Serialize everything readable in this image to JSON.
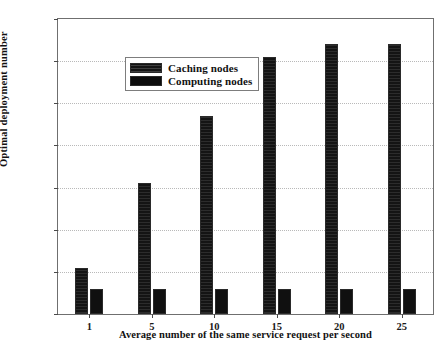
{
  "chart_data": {
    "type": "bar",
    "title": "",
    "xlabel": "Average number of the same service request per second",
    "ylabel": "Optimal deployment number",
    "categories": [
      "1",
      "5",
      "10",
      "15",
      "20",
      "25"
    ],
    "series": [
      {
        "name": "Caching nodes",
        "values": [
          11,
          31,
          47,
          61,
          64,
          64
        ]
      },
      {
        "name": "Computing nodes",
        "values": [
          6,
          6,
          6,
          6,
          6,
          6
        ]
      }
    ],
    "ylim": [
      0,
      70
    ],
    "yticks": [
      0,
      10,
      20,
      30,
      40,
      50,
      60,
      70
    ],
    "ytick_labels": [
      "0",
      "10",
      "20",
      "30",
      "40",
      "50",
      "60",
      "70"
    ],
    "grid": true,
    "grid_style": "dotted",
    "legend_position": "upper left",
    "colors": {
      "caching": "#141414",
      "computing": "#101010",
      "grid": "#b9b9b9",
      "axis": "#6f6f6f",
      "background": "#ffffff"
    }
  }
}
